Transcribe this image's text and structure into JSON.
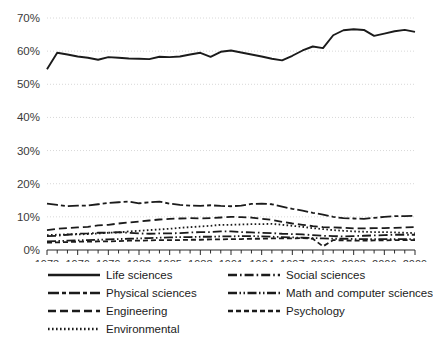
{
  "chart_data": {
    "type": "line",
    "title": "",
    "subtitle": "",
    "xlabel": "",
    "ylabel": "",
    "xlim": [
      1973,
      2009
    ],
    "ylim": [
      0,
      70
    ],
    "grid": true,
    "legend_position": "bottom",
    "y_ticks": [
      "0%",
      "10%",
      "20%",
      "30%",
      "40%",
      "50%",
      "60%",
      "70%"
    ],
    "y_tick_values": [
      0,
      10,
      20,
      30,
      40,
      50,
      60,
      70
    ],
    "x_ticks": [
      "1973",
      "1976",
      "1979",
      "1982",
      "1985",
      "1988",
      "1991",
      "1994",
      "1997",
      "2000",
      "2003",
      "2006",
      "2009"
    ],
    "x_tick_values": [
      1973,
      1976,
      1979,
      1982,
      1985,
      1988,
      1991,
      1994,
      1997,
      2000,
      2003,
      2006,
      2009
    ],
    "x": [
      1973,
      1974,
      1975,
      1976,
      1977,
      1978,
      1979,
      1980,
      1981,
      1982,
      1983,
      1984,
      1985,
      1986,
      1987,
      1988,
      1989,
      1990,
      1991,
      1992,
      1993,
      1994,
      1995,
      1996,
      1997,
      1998,
      1999,
      2000,
      2001,
      2002,
      2003,
      2004,
      2005,
      2006,
      2007,
      2008,
      2009
    ],
    "series": [
      {
        "name": "Life sciences",
        "dash": "solid",
        "values": [
          54.5,
          59.5,
          59.0,
          58.4,
          58.0,
          57.4,
          58.2,
          58.0,
          57.8,
          57.7,
          57.6,
          58.3,
          58.2,
          58.4,
          59.0,
          59.5,
          58.3,
          59.8,
          60.2,
          59.6,
          59.0,
          58.4,
          57.7,
          57.2,
          58.6,
          60.2,
          61.4,
          60.9,
          64.8,
          66.3,
          66.6,
          66.4,
          64.6,
          65.3,
          66.0,
          66.4,
          65.8
        ]
      },
      {
        "name": "Physical sciences",
        "dash": "long-dash-short",
        "values": [
          14.0,
          13.6,
          13.2,
          13.4,
          13.4,
          13.8,
          14.2,
          14.4,
          14.6,
          14.1,
          14.4,
          14.6,
          14.0,
          13.6,
          13.4,
          13.3,
          13.5,
          13.3,
          13.2,
          13.4,
          13.9,
          14.0,
          13.8,
          13.1,
          12.4,
          11.9,
          11.2,
          10.7,
          10.0,
          9.6,
          9.5,
          9.4,
          9.7,
          10.0,
          10.2,
          10.2,
          10.3
        ]
      },
      {
        "name": "Engineering",
        "dash": "dash",
        "values": [
          6.0,
          6.4,
          6.6,
          6.8,
          7.0,
          7.4,
          7.6,
          8.0,
          8.3,
          8.6,
          8.9,
          9.2,
          9.4,
          9.5,
          9.6,
          9.5,
          9.6,
          9.8,
          10.0,
          9.9,
          9.8,
          9.4,
          9.1,
          8.5,
          8.0,
          7.6,
          7.2,
          6.9,
          6.8,
          6.7,
          6.5,
          6.5,
          6.6,
          6.6,
          6.7,
          6.8,
          6.9
        ]
      },
      {
        "name": "Environmental",
        "dash": "dot",
        "values": [
          4.5,
          4.6,
          4.7,
          4.7,
          4.8,
          5.0,
          5.2,
          5.3,
          5.6,
          5.8,
          6.0,
          6.2,
          6.4,
          6.7,
          6.9,
          7.1,
          7.3,
          7.6,
          7.6,
          7.7,
          7.8,
          7.8,
          7.9,
          7.6,
          7.3,
          7.0,
          6.6,
          6.3,
          6.0,
          5.8,
          5.6,
          5.5,
          5.4,
          5.4,
          5.3,
          5.2,
          5.1
        ]
      },
      {
        "name": "Social sciences",
        "dash": "dash-dot",
        "values": [
          4.2,
          4.3,
          4.6,
          4.9,
          5.0,
          5.2,
          5.2,
          5.4,
          5.2,
          5.0,
          4.9,
          5.0,
          5.0,
          5.1,
          5.3,
          5.4,
          5.4,
          5.6,
          5.6,
          5.4,
          5.3,
          5.2,
          5.1,
          4.9,
          4.8,
          4.7,
          4.5,
          4.3,
          4.2,
          4.1,
          4.2,
          4.3,
          4.4,
          4.5,
          4.6,
          4.6,
          4.6
        ]
      },
      {
        "name": "Math and computer sciences",
        "dash": "dash-dot-dot",
        "values": [
          2.6,
          2.7,
          2.8,
          2.9,
          3.0,
          3.1,
          3.2,
          3.3,
          3.4,
          3.5,
          3.6,
          3.7,
          3.8,
          3.9,
          3.9,
          4.0,
          4.0,
          4.1,
          4.1,
          4.2,
          4.2,
          4.1,
          4.0,
          3.9,
          3.8,
          3.7,
          3.6,
          3.5,
          3.4,
          3.4,
          3.3,
          3.3,
          3.3,
          3.3,
          3.3,
          3.3,
          3.3
        ]
      },
      {
        "name": "Psychology",
        "dash": "short-dash",
        "values": [
          2.2,
          2.3,
          2.4,
          2.5,
          2.5,
          2.6,
          2.6,
          2.7,
          2.8,
          2.8,
          2.9,
          3.0,
          3.0,
          3.0,
          3.1,
          3.1,
          3.2,
          3.2,
          3.3,
          3.3,
          3.4,
          3.4,
          3.5,
          3.5,
          3.5,
          3.6,
          3.4,
          1.1,
          3.0,
          2.9,
          2.8,
          2.8,
          2.9,
          2.9,
          3.0,
          3.0,
          3.0
        ]
      }
    ]
  },
  "legend": {
    "left_column": [
      {
        "label": "Life sciences",
        "dash": "solid"
      },
      {
        "label": "Physical sciences",
        "dash": "long-dash-short"
      },
      {
        "label": "Engineering",
        "dash": "dash"
      },
      {
        "label": "Environmental",
        "dash": "dot"
      }
    ],
    "right_column": [
      {
        "label": "Social sciences",
        "dash": "dash-dot"
      },
      {
        "label": "Math and computer sciences",
        "dash": "dash-dot-dot"
      },
      {
        "label": "Psychology",
        "dash": "short-dash"
      }
    ]
  },
  "colors": {
    "line": "#1b1b1b",
    "grid": "#d8d8d8",
    "axis": "#2b2b2b",
    "tick_label": "#3a3a3a",
    "background": "#ffffff"
  }
}
